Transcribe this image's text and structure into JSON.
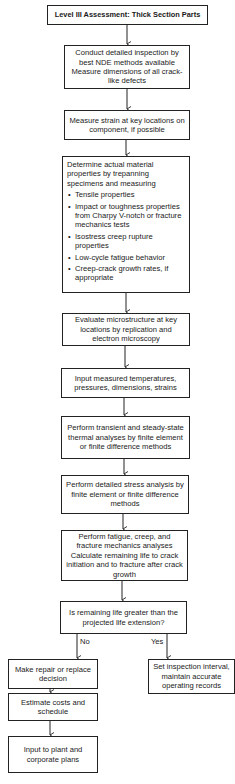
{
  "title": "Level III Assessment: Thick Section Parts",
  "steps": [
    {
      "id": "inspect",
      "text": "Conduct detailed inspection by best NDE methods available Measure dimensions of all crack-like defects"
    },
    {
      "id": "strain",
      "text": "Measure strain at key locations on component, if possible"
    },
    {
      "id": "material",
      "intro": "Determine actual material properties by trepanning specimens and measuring",
      "bullets": [
        "Tensile properties",
        "Impact or toughness properties from Charpy V-notch or fracture mechanics tests",
        "Isostress creep rupture properties",
        "Low-cycle fatigue behavior",
        "Creep-crack growth rates, if appropriate"
      ]
    },
    {
      "id": "microstructure",
      "text": "Evaluate microstructure at key locations by replication and electron microscopy"
    },
    {
      "id": "input",
      "text": "Input measured temperatures, pressures, dimensions, strains"
    },
    {
      "id": "thermal",
      "text": "Perform transient and steady-state thermal analyses by finite element or finite difference methods"
    },
    {
      "id": "stress",
      "text": "Perform detailed stress analysis by finite element or finite difference methods"
    },
    {
      "id": "fatigue",
      "text": "Perform fatigue, creep, and fracture mechanics analyses Calculate remaining life to crack initiation and to fracture after crack growth"
    }
  ],
  "decision": {
    "text": "Is remaining life greater than the projected life extension?",
    "no_label": "No",
    "yes_label": "Yes"
  },
  "no_branch": [
    {
      "id": "repair",
      "text": "Make repair or replace decision"
    },
    {
      "id": "costs",
      "text": "Estimate costs and schedule"
    },
    {
      "id": "plans",
      "text": "Input to plant and corporate plans"
    }
  ],
  "yes_branch": [
    {
      "id": "interval",
      "text": "Set inspection interval, maintain accurate operating records"
    }
  ]
}
